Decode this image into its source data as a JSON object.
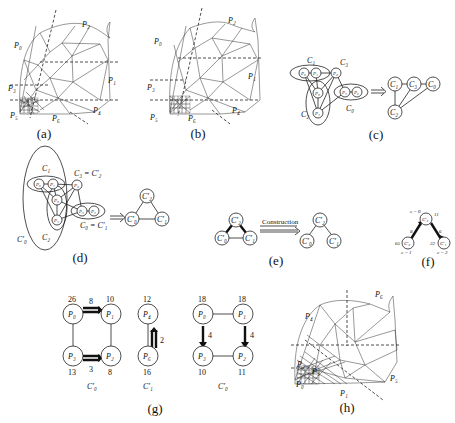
{
  "figure": {
    "panels": [
      {
        "id": "a",
        "caption": "(a)",
        "type": "mesh-partition",
        "labels": [
          "P₂",
          "P₀",
          "P₁",
          "P₃",
          "P₄",
          "P₅",
          "P₆"
        ]
      },
      {
        "id": "b",
        "caption": "(b)",
        "type": "mesh-partition",
        "labels": [
          "P₂",
          "P₀",
          "P₁",
          "P₃",
          "P₄",
          "P₅",
          "P₆"
        ]
      },
      {
        "id": "c",
        "caption": "(c)",
        "type": "cluster-graph",
        "clusters": [
          "C₁",
          "C₂",
          "C₃",
          "C₀"
        ],
        "processors": [
          "P₀",
          "P₁",
          "P₂",
          "P₃",
          "P₄",
          "P₅",
          "P₆"
        ],
        "result_nodes": [
          "C₁",
          "C₃",
          "C₀",
          "C₂"
        ]
      },
      {
        "id": "d",
        "caption": "(d)",
        "type": "merged-cluster-graph",
        "cluster_labels": [
          "C₁",
          "C₃ = C'₂",
          "C₂",
          "C₀ = C'₁",
          "C'₀"
        ],
        "processors": [
          "P₀",
          "P₁",
          "P₂",
          "P₃",
          "P₄",
          "P₅",
          "P₆"
        ],
        "result_nodes": [
          "C'₂",
          "C'₀",
          "C'₁"
        ]
      },
      {
        "id": "e",
        "caption": "(e)",
        "type": "construction",
        "arrow_label": "Construction",
        "left_nodes": [
          "C'₂",
          "C'₀",
          "C'₁"
        ],
        "right_nodes": [
          "C'₂",
          "C'₀",
          "C'₁"
        ]
      },
      {
        "id": "f",
        "caption": "(f)",
        "type": "weighted-tree",
        "nodes": [
          {
            "label": "C'₂",
            "load": "11",
            "annot": "c = 0"
          },
          {
            "label": "C'₀",
            "load": "65",
            "annot": "c = 1"
          },
          {
            "label": "C'₁",
            "load": "22",
            "annot": "c = 2"
          }
        ],
        "edge_weights": [
          "8",
          "6"
        ]
      },
      {
        "id": "g",
        "caption": "(g)",
        "type": "load-balance",
        "groups": [
          {
            "name": "C'₀",
            "nodes": [
              {
                "label": "P₀",
                "load": "26"
              },
              {
                "label": "P₁",
                "load": "10"
              },
              {
                "label": "P₃",
                "load": "13"
              },
              {
                "label": "P₂",
                "load": "8"
              }
            ],
            "flows": [
              "8",
              "3"
            ]
          },
          {
            "name": "C'₁",
            "nodes": [
              {
                "label": "P₄",
                "load": "12"
              },
              {
                "label": "P₆",
                "load": "16"
              }
            ],
            "flows": [
              "2"
            ]
          },
          {
            "name": "C'₀",
            "nodes": [
              {
                "label": "P₀",
                "load": "18"
              },
              {
                "label": "P₁",
                "load": "18"
              },
              {
                "label": "P₃",
                "load": "10"
              },
              {
                "label": "P₂",
                "load": "11"
              }
            ],
            "flows": [
              "4",
              "4"
            ]
          }
        ]
      },
      {
        "id": "h",
        "caption": "(h)",
        "type": "mesh-partition",
        "labels": [
          "P₆",
          "P₄",
          "P₂",
          "P₅",
          "P₀",
          "P₁",
          "P₃"
        ]
      }
    ]
  }
}
